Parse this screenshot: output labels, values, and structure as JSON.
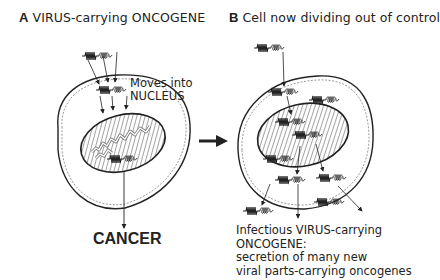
{
  "panel_a": {
    "letter": "A",
    "title": "VIRUS-carrying ONCOGENE",
    "annotation_line1": "Moves into",
    "annotation_line2": "NUCLEUS",
    "outcome": "CANCER"
  },
  "panel_b": {
    "letter": "B",
    "title": "Cell now dividing out of control",
    "caption_line1": "Infectious VIRUS-carrying",
    "caption_line2": "ONCOGENE:",
    "caption_line3": "secretion of many new",
    "caption_line4": "viral parts-carrying oncogenes"
  },
  "colors": {
    "ink": "#222222",
    "background": "#ffffff"
  },
  "icons": {
    "virus_oncogene": "zigzag-coil-virus-glyph",
    "transition_arrow": "right-arrow"
  }
}
